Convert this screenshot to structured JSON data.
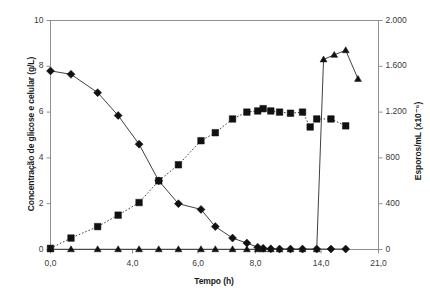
{
  "chart_data": {
    "type": "line",
    "title": "",
    "xlabel": "Tempo (h)",
    "ylabel": "Concentração de glicose e celular (g/L)",
    "ylabel_right": "Esporos/mL  (x10⁻⁶)",
    "xlim": [
      0,
      21
    ],
    "ylim": [
      0,
      10
    ],
    "ylim_right": [
      0,
      2000
    ],
    "grid": false,
    "legend": "none",
    "xticks": [
      0,
      4,
      6,
      8,
      14,
      21
    ],
    "xtick_labels": [
      "0,0",
      "4,0",
      "6,0",
      "8,0",
      "14,0",
      "21,0"
    ],
    "yticks_left": [
      0,
      2,
      4,
      6,
      8,
      10
    ],
    "ytick_labels_left": [
      "0",
      "2",
      "4",
      "6",
      "8",
      "10"
    ],
    "yticks_right": [
      0,
      400,
      800,
      1200,
      1600,
      2000
    ],
    "ytick_labels_right": [
      "0",
      "400",
      "800",
      "1.200",
      "1.600",
      "2.000"
    ],
    "series": [
      {
        "name": "Glicose",
        "marker": "diamond",
        "axis": "left",
        "linestyle": "solid",
        "x": [
          0.0,
          1.0,
          2.3,
          3.3,
          4.2,
          4.8,
          5.4,
          6.1,
          6.6,
          7.2,
          7.7,
          8.2,
          8.7,
          9.4,
          10.2,
          11.2,
          12.3,
          13.6,
          15.2,
          17.0
        ],
        "y": [
          7.8,
          7.65,
          6.85,
          5.85,
          4.6,
          3.0,
          2.0,
          1.75,
          1.0,
          0.5,
          0.28,
          0.1,
          0.05,
          0.03,
          0.02,
          0.02,
          0.02,
          0.02,
          0.02,
          0.02
        ]
      },
      {
        "name": "Concentração celular",
        "marker": "square",
        "axis": "left",
        "linestyle": "dotted",
        "x": [
          0.0,
          1.0,
          2.3,
          3.3,
          4.2,
          4.8,
          5.4,
          6.1,
          6.6,
          7.2,
          7.7,
          8.2,
          8.7,
          9.4,
          10.2,
          11.2,
          12.3,
          13.0,
          13.6,
          15.2,
          17.0
        ],
        "y": [
          0.05,
          0.5,
          1.0,
          1.5,
          2.05,
          3.0,
          3.7,
          4.75,
          5.1,
          5.7,
          6.0,
          6.05,
          6.15,
          6.05,
          6.0,
          5.95,
          6.0,
          5.35,
          5.7,
          5.7,
          5.4
        ]
      },
      {
        "name": "Esporos",
        "marker": "triangle",
        "axis": "right",
        "linestyle": "solid",
        "x": [
          0.0,
          1.0,
          2.3,
          3.3,
          4.2,
          4.8,
          5.4,
          6.1,
          6.6,
          7.2,
          7.7,
          8.2,
          8.7,
          9.4,
          10.2,
          11.2,
          12.3,
          13.6,
          14.3,
          15.6,
          17.0,
          18.5
        ],
        "y": [
          2,
          2,
          2,
          2,
          2,
          2,
          2,
          2,
          2,
          2,
          2,
          2,
          2,
          2,
          2,
          2,
          2,
          2,
          1660,
          1700,
          1740,
          1490
        ]
      }
    ]
  }
}
